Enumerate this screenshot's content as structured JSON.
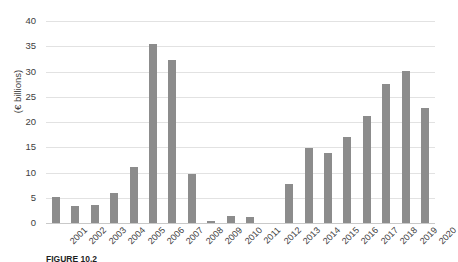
{
  "chart_data": {
    "type": "bar",
    "title": "",
    "xlabel": "",
    "ylabel": "(€ billions)",
    "ylim": [
      0,
      40
    ],
    "yticks": [
      0,
      5,
      10,
      15,
      20,
      25,
      30,
      35,
      40
    ],
    "grid": true,
    "legend": "none",
    "bar_color": "#8c8c8c",
    "categories": [
      "2001",
      "2002",
      "2003",
      "2004",
      "2005",
      "2006",
      "2007",
      "2008",
      "2009",
      "2010",
      "2011",
      "2012",
      "2013",
      "2014",
      "2015",
      "2016",
      "2017",
      "2018",
      "2019",
      "2020"
    ],
    "values": [
      5.2,
      3.4,
      3.6,
      6.0,
      11.1,
      35.5,
      32.3,
      9.8,
      0.4,
      1.4,
      1.2,
      0.0,
      7.7,
      14.9,
      13.9,
      17.0,
      21.2,
      27.6,
      30.2,
      22.8
    ],
    "series": [
      {
        "name": "Value (€ billions)",
        "values": [
          5.2,
          3.4,
          3.6,
          6.0,
          11.1,
          35.5,
          32.3,
          9.8,
          0.4,
          1.4,
          1.2,
          0.0,
          7.7,
          14.9,
          13.9,
          17.0,
          21.2,
          27.6,
          30.2,
          22.8
        ]
      }
    ]
  },
  "caption": {
    "label": "FIGURE 10.2",
    "rest": ""
  }
}
